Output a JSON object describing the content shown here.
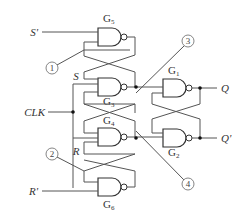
{
  "diagram": {
    "type": "logic-circuit",
    "inputs": {
      "s_prime": "S'",
      "r_prime": "R'",
      "clk": "CLK"
    },
    "internal_labels": {
      "s": "S",
      "r": "R"
    },
    "outputs": {
      "q": "Q",
      "q_prime": "Q'"
    },
    "gates": [
      {
        "id": "G5",
        "letter": "G",
        "sub": "5",
        "type": "NAND"
      },
      {
        "id": "G3",
        "letter": "G",
        "sub": "3",
        "type": "NAND"
      },
      {
        "id": "G4",
        "letter": "G",
        "sub": "4",
        "type": "NAND"
      },
      {
        "id": "G6",
        "letter": "G",
        "sub": "6",
        "type": "NAND"
      },
      {
        "id": "G1",
        "letter": "G",
        "sub": "1",
        "type": "NAND"
      },
      {
        "id": "G2",
        "letter": "G",
        "sub": "2",
        "type": "NAND"
      }
    ],
    "markers": [
      "1",
      "2",
      "3",
      "4"
    ]
  }
}
